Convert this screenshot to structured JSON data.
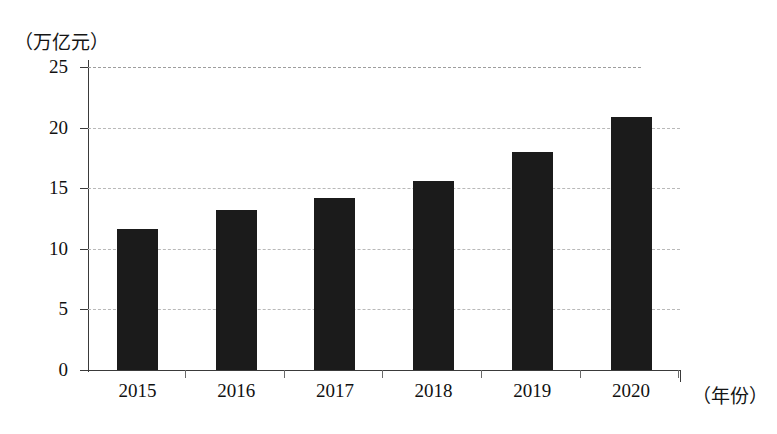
{
  "chart_data": {
    "type": "bar",
    "title": "",
    "subtitle": "",
    "xlabel": "（年份）",
    "ylabel": "（万亿元）",
    "categories": [
      "2015",
      "2016",
      "2017",
      "2018",
      "2019",
      "2020"
    ],
    "values": [
      11.6,
      13.2,
      14.2,
      15.6,
      18.0,
      20.9
    ],
    "series": [
      {
        "name": "",
        "values": [
          11.6,
          13.2,
          14.2,
          15.6,
          18.0,
          20.9
        ]
      }
    ],
    "ylim": [
      0,
      25
    ],
    "yticks": [
      0,
      5,
      10,
      15,
      20,
      25
    ],
    "ytick_labels": [
      "0",
      "5",
      "10",
      "15",
      "20",
      "25"
    ],
    "xtick_labels": [
      "2015",
      "2016",
      "2017",
      "2018",
      "2019",
      "2020"
    ],
    "grid": true,
    "grid_axis": "y",
    "grid_style": "dashed",
    "legend": false,
    "legend_position": "none",
    "bar_color": "#1b1b1b",
    "grid_color": "#b9b9b9",
    "axis_color": "#3a3a3a",
    "background_color": "#ffffff"
  },
  "axes": {
    "y_unit_label": "（万亿元）",
    "x_unit_label": "（年份）"
  }
}
